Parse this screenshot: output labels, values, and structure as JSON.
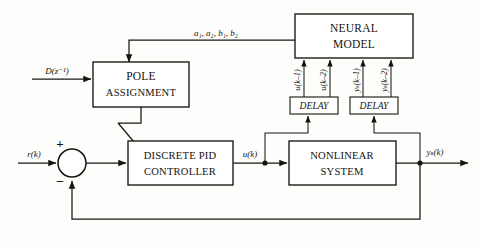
{
  "diagram": {
    "blocks": {
      "neural_model": {
        "line1": "NEURAL",
        "line2": "MODEL"
      },
      "pole_assignment": {
        "line1": "POLE",
        "line2": "ASSIGNMENT"
      },
      "pid_controller": {
        "line1": "DISCRETE PID",
        "line2": "CONTROLLER"
      },
      "nonlinear_system": {
        "line1": "NONLINEAR",
        "line2": "SYSTEM"
      },
      "delay_u": {
        "label": "DELAY"
      },
      "delay_y": {
        "label": "DELAY"
      }
    },
    "signals": {
      "design_input": "D(z⁻¹)",
      "reference": "r(k)",
      "control": "u(k)",
      "output": "yₛ(k)",
      "parameters": "a₁, a₂, b₁, b₂",
      "u_delay_1": "u(k–1)",
      "u_delay_2": "u(k–2)",
      "y_delay_1": "yₛ(k–1)",
      "y_delay_2": "yₛ(k–2)"
    },
    "summing_junction": {
      "plus": "+",
      "minus": "–"
    },
    "colors": {
      "line": "#1a1713",
      "text": "#16130f",
      "background": "#fdfdfc"
    }
  }
}
